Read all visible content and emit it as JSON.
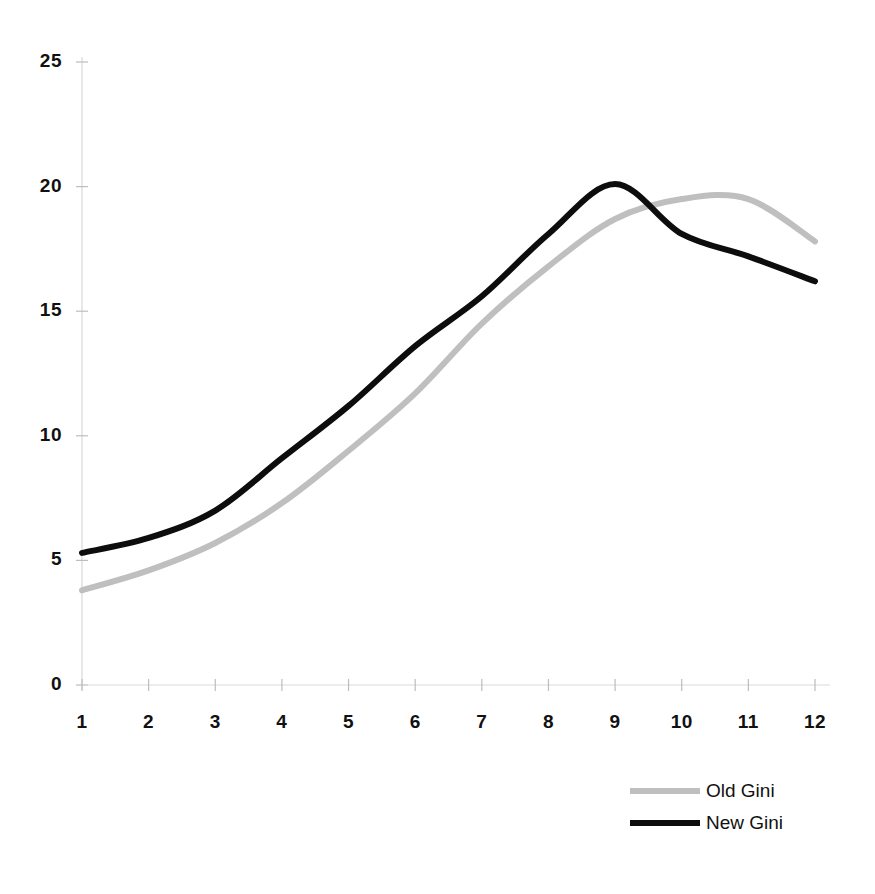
{
  "chart_data": {
    "type": "line",
    "title": "",
    "subtitle": "",
    "xlabel": "",
    "ylabel": "",
    "x": [
      1,
      2,
      3,
      4,
      5,
      6,
      7,
      8,
      9,
      10,
      11,
      12
    ],
    "xtick_labels": [
      "1",
      "2",
      "3",
      "4",
      "5",
      "6",
      "7",
      "8",
      "9",
      "10",
      "11",
      "12"
    ],
    "ytick_labels": [
      "0",
      "5",
      "10",
      "15",
      "20",
      "25"
    ],
    "yticks": [
      0,
      5,
      10,
      15,
      20,
      25
    ],
    "xlim": [
      1,
      12
    ],
    "ylim": [
      0,
      25
    ],
    "grid": false,
    "legend_position": "bottom-right",
    "series": [
      {
        "name": "Old Gini",
        "color": "#bfbfbf",
        "values": [
          3.8,
          4.6,
          5.7,
          7.3,
          9.4,
          11.7,
          14.5,
          16.8,
          18.7,
          19.5,
          19.5,
          17.8
        ]
      },
      {
        "name": "New Gini",
        "color": "#0d0d0d",
        "values": [
          5.3,
          5.9,
          7.0,
          9.1,
          11.2,
          13.6,
          15.6,
          18.1,
          20.1,
          18.1,
          17.2,
          16.2
        ]
      }
    ]
  },
  "legend": {
    "entries": [
      {
        "label": "Old Gini",
        "color": "#bfbfbf"
      },
      {
        "label": "New Gini",
        "color": "#0d0d0d"
      }
    ]
  },
  "axes": {
    "y_labels": [
      "25",
      "20",
      "15",
      "10",
      "5",
      "0"
    ],
    "x_labels": [
      "1",
      "2",
      "3",
      "4",
      "5",
      "6",
      "7",
      "8",
      "9",
      "10",
      "11",
      "12"
    ]
  },
  "colors": {
    "background": "#ffffff",
    "axis": "#d9d9d9",
    "tick": "#bdbdbd",
    "text": "#111111",
    "old_gini": "#bfbfbf",
    "new_gini": "#0d0d0d"
  }
}
